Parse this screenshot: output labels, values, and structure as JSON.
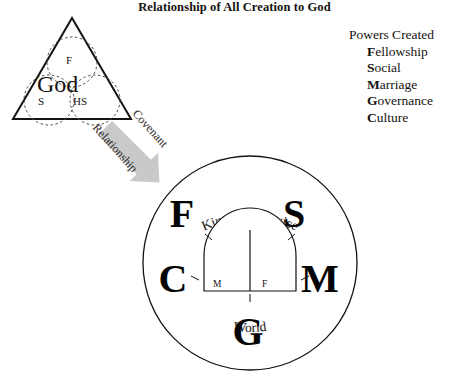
{
  "title": "Relationship of All Creation to God",
  "powers": {
    "heading": "Powers Created",
    "items": [
      {
        "initial": "F",
        "rest": "ellowship"
      },
      {
        "initial": "S",
        "rest": "ocial"
      },
      {
        "initial": "M",
        "rest": "arriage"
      },
      {
        "initial": "G",
        "rest": "overnance"
      },
      {
        "initial": "C",
        "rest": "ulture"
      }
    ]
  },
  "trinity": {
    "center_label": "God",
    "persons": [
      {
        "abbr": "F",
        "position": "top"
      },
      {
        "abbr": "S",
        "position": "bottom-left"
      },
      {
        "abbr": "HS",
        "position": "bottom-right"
      }
    ]
  },
  "arrow": {
    "upper_label": "Covenant",
    "lower_label": "Relationship",
    "color": "#c9c9c9"
  },
  "creation_circle": {
    "top_arc_label": "Kingdom Service",
    "bottom_arc_label": "World",
    "letters": [
      {
        "char": "F",
        "position": "top-left"
      },
      {
        "char": "S",
        "position": "top-right"
      },
      {
        "char": "C",
        "position": "left"
      },
      {
        "char": "M",
        "position": "right"
      },
      {
        "char": "G",
        "position": "bottom"
      }
    ],
    "arch": {
      "left_cell": "M",
      "right_cell": "F"
    }
  },
  "colors": {
    "stroke": "#15120f",
    "background": "#ffffff",
    "arrow_fill": "#c9c9c9"
  }
}
